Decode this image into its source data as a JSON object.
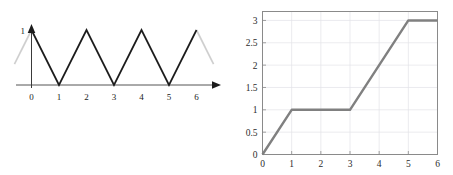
{
  "figure": {
    "panel_count": 2,
    "background_color": "#ffffff"
  },
  "chart_data": [
    {
      "id": "left-triangle-wave",
      "type": "line",
      "title": "",
      "subtitle": "",
      "xlabel": "",
      "ylabel": "",
      "xlim": [
        0,
        6
      ],
      "ylim": [
        0,
        1
      ],
      "grid": false,
      "legend": null,
      "xticks": [
        "0",
        "1",
        "2",
        "3",
        "4",
        "5",
        "6"
      ],
      "xtick_values": [
        0,
        1,
        2,
        3,
        4,
        5,
        6
      ],
      "yticks": [
        "1"
      ],
      "ytick_values": [
        1
      ],
      "axis_style": "arrowed-half-axes",
      "line_color": "#1c1c1c",
      "ghost_color": "#cfcfcf",
      "description": "Triangle wave, period 2, amplitude 1",
      "x": [
        0,
        1,
        2,
        3,
        4,
        5,
        6
      ],
      "values": [
        1,
        0,
        1,
        0,
        1,
        0,
        1
      ],
      "ghost_segments": [
        {
          "x": [
            -0.62,
            0
          ],
          "values": [
            0.38,
            1
          ]
        },
        {
          "x": [
            6,
            6.62
          ],
          "values": [
            1,
            0.38
          ]
        }
      ]
    },
    {
      "id": "right-step-ramp",
      "type": "line",
      "title": "",
      "subtitle": "",
      "xlabel": "",
      "ylabel": "",
      "xlim": [
        0,
        6
      ],
      "ylim": [
        0,
        3.2
      ],
      "grid": true,
      "grid_color": "#e3e3e8",
      "legend": null,
      "xticks": [
        "0",
        "1",
        "2",
        "3",
        "4",
        "5",
        "6"
      ],
      "xtick_values": [
        0,
        1,
        2,
        3,
        4,
        5,
        6
      ],
      "yticks": [
        "0",
        "0.5",
        "1",
        "1.5",
        "2",
        "2.5",
        "3"
      ],
      "ytick_values": [
        0,
        0.5,
        1,
        1.5,
        2,
        2.5,
        3
      ],
      "axis_style": "boxed-frame",
      "line_color": "#808080",
      "frame_color": "#8a8a8a",
      "description": "Piecewise linear integral: ramp 0-1, flat 1-3, ramp 3-5, flat 5-6",
      "x": [
        0,
        1,
        3,
        5,
        6
      ],
      "values": [
        0,
        1,
        1,
        3,
        3
      ]
    }
  ]
}
